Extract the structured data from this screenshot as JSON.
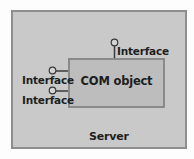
{
  "diagram": {
    "container": {
      "label": "Server"
    },
    "component": {
      "label": "COM object"
    },
    "interfaces": [
      {
        "label": "Interface",
        "side": "top"
      },
      {
        "label": "Interface",
        "side": "left"
      },
      {
        "label": "Interface",
        "side": "left"
      }
    ]
  }
}
